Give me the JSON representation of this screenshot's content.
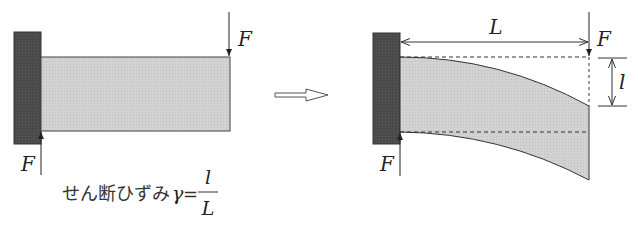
{
  "diagram": {
    "colors": {
      "wall": "#4a4a4a",
      "beam_fill": "#d0d0d0",
      "line": "#333333",
      "background": "#ffffff"
    },
    "left_figure": {
      "force_top_label": "F",
      "force_bottom_label": "F",
      "formula": {
        "prefix": "せん断ひずみ",
        "symbol": "γ",
        "equals": "=",
        "numerator": "l",
        "denominator": "L"
      }
    },
    "transition_arrow": "⇨",
    "right_figure": {
      "length_label": "L",
      "force_top_label": "F",
      "force_bottom_label": "F",
      "displacement_label": "l"
    }
  }
}
